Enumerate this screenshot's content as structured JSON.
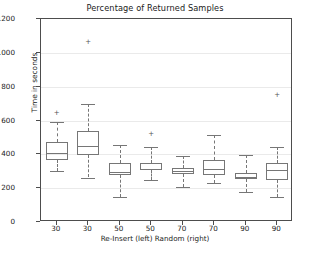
{
  "chart_data": {
    "type": "boxplot",
    "title": "Percentage of Returned Samples",
    "xlabel": "Re-Insert (left)  Random (right)",
    "ylabel": "Time in seconds",
    "ylim": [
      0,
      1200
    ],
    "yticks": [
      0,
      200,
      400,
      600,
      800,
      1000,
      1200
    ],
    "grid": true,
    "legend": "none",
    "categories": [
      "30",
      "30",
      "50",
      "50",
      "70",
      "70",
      "90",
      "90"
    ],
    "groups": [
      "Re-Insert",
      "Random",
      "Re-Insert",
      "Random",
      "Re-Insert",
      "Random",
      "Re-Insert",
      "Random"
    ],
    "boxes": [
      {
        "label": "30",
        "group": "Re-Insert",
        "whisker_low": 300,
        "q1": 365,
        "median": 410,
        "q3": 470,
        "whisker_high": 592,
        "outliers": [
          640
        ]
      },
      {
        "label": "30",
        "group": "Random",
        "whisker_low": 263,
        "q1": 398,
        "median": 450,
        "q3": 535,
        "whisker_high": 698,
        "outliers": [
          1060
        ]
      },
      {
        "label": "50",
        "group": "Re-Insert",
        "whisker_low": 145,
        "q1": 275,
        "median": 295,
        "q3": 350,
        "whisker_high": 455,
        "outliers": []
      },
      {
        "label": "50",
        "group": "Random",
        "whisker_low": 248,
        "q1": 305,
        "median": 315,
        "q3": 348,
        "whisker_high": 445,
        "outliers": [
          515
        ]
      },
      {
        "label": "70",
        "group": "Re-Insert",
        "whisker_low": 208,
        "q1": 282,
        "median": 300,
        "q3": 322,
        "whisker_high": 390,
        "outliers": []
      },
      {
        "label": "70",
        "group": "Random",
        "whisker_low": 230,
        "q1": 280,
        "median": 312,
        "q3": 368,
        "whisker_high": 515,
        "outliers": []
      },
      {
        "label": "90",
        "group": "Re-Insert",
        "whisker_low": 178,
        "q1": 252,
        "median": 268,
        "q3": 292,
        "whisker_high": 395,
        "outliers": []
      },
      {
        "label": "90",
        "group": "Random",
        "whisker_low": 145,
        "q1": 248,
        "median": 305,
        "q3": 350,
        "whisker_high": 445,
        "outliers": [
          750
        ]
      }
    ],
    "colors": {
      "box_edge": "#767676",
      "median": "#767676",
      "whisker": "#767676",
      "outlier": "#555555",
      "grid": "#eaeaea",
      "axis": "#4d4d4d",
      "text": "#1a1a1a",
      "background": "#ffffff"
    }
  }
}
